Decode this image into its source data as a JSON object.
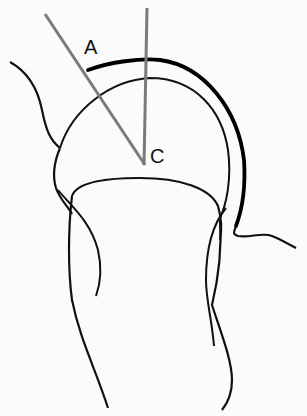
{
  "diagram": {
    "labels": {
      "point_a": "A",
      "center_c": "C"
    },
    "colors": {
      "background": "#fbfbfb",
      "outline": "#111111",
      "reference_lines": "#7a7a7a",
      "thick_arc": "#000000"
    },
    "elements": [
      "humeral-head-circle",
      "thick-articular-arc",
      "glenoid-outline",
      "shaft-outline",
      "reference-line-vertical",
      "reference-line-oblique"
    ]
  }
}
